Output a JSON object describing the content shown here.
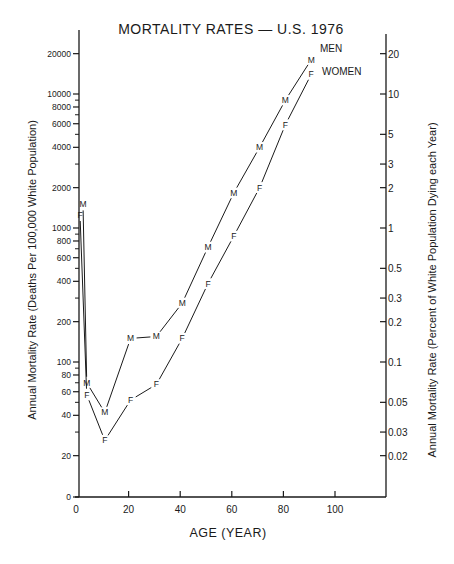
{
  "chart_data": {
    "type": "line",
    "title": "MORTALITY RATES — U.S. 1976",
    "xlabel": "AGE (YEAR)",
    "ylabel": "Annual Mortality Rate (Deaths Per 100,000 White Population)",
    "ylabel_right": "Annual Mortality Rate (Percent of White Population Dying each Year)",
    "x_ticks": [
      0,
      20,
      40,
      60,
      80,
      100
    ],
    "xlim": [
      0,
      115
    ],
    "y_scale": "log",
    "y_ticks_left": [
      20,
      40,
      60,
      80,
      100,
      200,
      400,
      600,
      800,
      1000,
      2000,
      4000,
      6000,
      8000,
      10000,
      20000
    ],
    "y_ticks_left_labels": [
      "0",
      "20",
      "40",
      "60",
      "80",
      "100",
      "200",
      "400",
      "600",
      "800",
      "1000",
      "2000",
      "4000",
      "6000",
      "8000",
      "10000",
      "20000"
    ],
    "y_ticks_right": [
      "20",
      "10",
      "5",
      "3",
      "2",
      "1",
      "0.5",
      "0.3",
      "0.2",
      "0.1",
      "0.05",
      "0.03",
      "0.02"
    ],
    "grid": false,
    "legend_position": "inline-top-right",
    "series": [
      {
        "name": "MEN",
        "marker": "M",
        "x": [
          0,
          3,
          10,
          20,
          30,
          40,
          50,
          60,
          70,
          80,
          90
        ],
        "values": [
          1500,
          70,
          42,
          150,
          155,
          275,
          720,
          1830,
          4000,
          9000,
          18000
        ]
      },
      {
        "name": "WOMEN",
        "marker": "F",
        "x": [
          0,
          3,
          10,
          20,
          30,
          40,
          50,
          60,
          70,
          80,
          90
        ],
        "values": [
          1250,
          57,
          26,
          52,
          68,
          150,
          385,
          870,
          2000,
          5900,
          14000
        ]
      }
    ]
  }
}
